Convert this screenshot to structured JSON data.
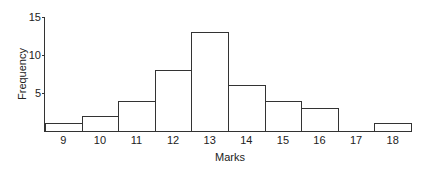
{
  "chart_data": {
    "type": "bar",
    "title": "",
    "xlabel": "Marks",
    "ylabel": "Frequency",
    "categories": [
      "9",
      "10",
      "11",
      "12",
      "13",
      "14",
      "15",
      "16",
      "17",
      "18"
    ],
    "values": [
      1,
      2,
      4,
      8,
      13,
      6,
      4,
      3,
      0,
      1
    ],
    "ylim": [
      0,
      15
    ],
    "yticks": [
      "5",
      "10",
      "15"
    ],
    "ytick_values": [
      5,
      10,
      15
    ],
    "grid": false,
    "legend": null,
    "histogram": true,
    "bar_fill": "#ffffff",
    "bar_edge": "#333333"
  }
}
